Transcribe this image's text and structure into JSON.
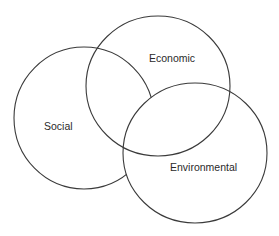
{
  "diagram": {
    "type": "venn",
    "stroke_color": "#3a3a3a",
    "background": "#ffffff",
    "sets": [
      {
        "id": "social",
        "label": "Social"
      },
      {
        "id": "economic",
        "label": "Economic"
      },
      {
        "id": "environmental",
        "label": "Environmental"
      }
    ]
  }
}
